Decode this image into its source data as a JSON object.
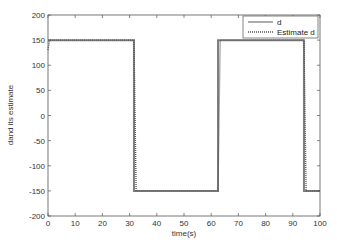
{
  "chart_data": {
    "type": "line",
    "title": "",
    "xlabel": "time(s)",
    "ylabel": "dand its estimate",
    "xlim": [
      0,
      100
    ],
    "ylim": [
      -200,
      200
    ],
    "xticks": [
      0,
      10,
      20,
      30,
      40,
      50,
      60,
      70,
      80,
      90,
      100
    ],
    "yticks": [
      200,
      150,
      100,
      50,
      0,
      -50,
      -100,
      -150,
      -200
    ],
    "grid": false,
    "legend_position": "upper right",
    "series": [
      {
        "name": "d",
        "style": "solid",
        "color": "#7f7f7f",
        "x": [
          0,
          31.6,
          31.6,
          62.5,
          62.5,
          94.1,
          94.1,
          100
        ],
        "y": [
          150,
          150,
          -150,
          -150,
          150,
          150,
          -150,
          -150
        ]
      },
      {
        "name": "Estimate d",
        "style": "dotted",
        "color": "#555555",
        "x": [
          0,
          0.5,
          1,
          31.6,
          32.4,
          62.5,
          63.3,
          94.1,
          94.9,
          100
        ],
        "y": [
          130,
          148,
          150,
          150,
          -150,
          -150,
          150,
          150,
          -150,
          -150
        ]
      }
    ]
  },
  "legend": {
    "items": [
      {
        "label": "d"
      },
      {
        "label": "Estimate d"
      }
    ]
  }
}
